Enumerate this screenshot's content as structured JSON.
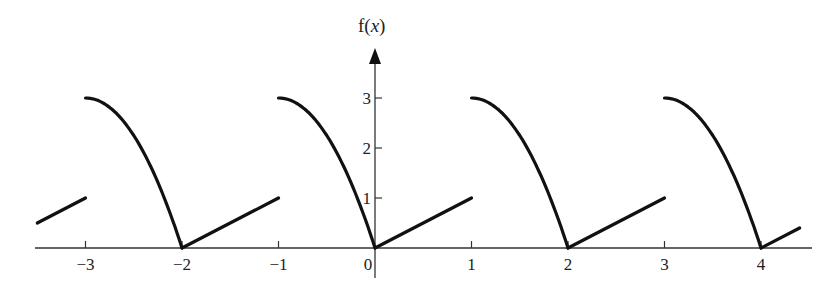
{
  "chart_data": {
    "type": "line",
    "title": "",
    "xlabel": "",
    "ylabel": "f(x)",
    "xlim": [
      -3.5,
      4.5
    ],
    "ylim": [
      0,
      3.5
    ],
    "grid": false,
    "legend": null,
    "x_ticks": [
      -3,
      -2,
      -1,
      0,
      1,
      2,
      3,
      4
    ],
    "x_tick_labels": [
      "−3",
      "−2",
      "−1",
      "0",
      "1",
      "2",
      "3",
      "4"
    ],
    "y_ticks": [
      1,
      2,
      3
    ],
    "y_tick_labels": [
      "1",
      "2",
      "3"
    ],
    "period": 2,
    "series": [
      {
        "name": "segment-linear",
        "x": [
          -3.5,
          -3
        ],
        "y": [
          0.5,
          1
        ]
      },
      {
        "name": "segment-curve",
        "x": [
          -3,
          -2.75,
          -2.5,
          -2.25,
          -2
        ],
        "y": [
          3,
          2.44,
          1.75,
          0.94,
          0
        ]
      },
      {
        "name": "segment-linear",
        "x": [
          -2,
          -1
        ],
        "y": [
          0,
          1
        ]
      },
      {
        "name": "segment-curve",
        "x": [
          -1,
          -0.75,
          -0.5,
          -0.25,
          0
        ],
        "y": [
          3,
          2.44,
          1.75,
          0.94,
          0
        ]
      },
      {
        "name": "segment-linear",
        "x": [
          0,
          1
        ],
        "y": [
          0,
          1
        ]
      },
      {
        "name": "segment-curve",
        "x": [
          1,
          1.25,
          1.5,
          1.75,
          2
        ],
        "y": [
          3,
          2.44,
          1.75,
          0.94,
          0
        ]
      },
      {
        "name": "segment-linear",
        "x": [
          2,
          3
        ],
        "y": [
          0,
          1
        ]
      },
      {
        "name": "segment-curve",
        "x": [
          3,
          3.25,
          3.5,
          3.75,
          4
        ],
        "y": [
          3,
          2.44,
          1.75,
          0.94,
          0
        ]
      },
      {
        "name": "segment-linear",
        "x": [
          4,
          4.4
        ],
        "y": [
          0,
          0.4
        ]
      }
    ]
  },
  "labels": {
    "y_axis_title_prefix": "f(",
    "y_axis_title_var": "x",
    "y_axis_title_suffix": ")"
  },
  "colors": {
    "curve": "#111111",
    "axis": "#333333"
  }
}
